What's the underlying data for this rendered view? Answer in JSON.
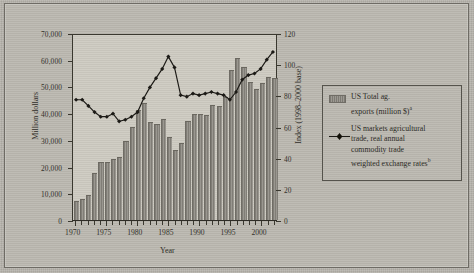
{
  "chart_data": {
    "type": "bar",
    "title": "",
    "xlabel": "Year",
    "ylabel": "Million dollars",
    "y2label": "Index (1998–2000 base)",
    "ylim": [
      0,
      70000
    ],
    "y2lim": [
      0,
      120
    ],
    "xlim": [
      1969.5,
      2002.5
    ],
    "grid": false,
    "legend_position": "right-outside",
    "ytick_labels": [
      "0",
      "10,000",
      "20,000",
      "30,000",
      "40,000",
      "50,000",
      "60,000",
      "70,000"
    ],
    "ytick_values": [
      0,
      10000,
      20000,
      30000,
      40000,
      50000,
      60000,
      70000
    ],
    "y2tick_labels": [
      "0",
      "20",
      "40",
      "60",
      "80",
      "100",
      "120"
    ],
    "y2tick_values": [
      0,
      20,
      40,
      60,
      80,
      100,
      120
    ],
    "xtick_labels": [
      "1970",
      "1975",
      "1980",
      "1985",
      "1990",
      "1995",
      "2000"
    ],
    "xtick_values": [
      1970,
      1975,
      1980,
      1985,
      1990,
      1995,
      2000
    ],
    "categories": [
      1970,
      1971,
      1972,
      1973,
      1974,
      1975,
      1976,
      1977,
      1978,
      1979,
      1980,
      1981,
      1982,
      1983,
      1984,
      1985,
      1986,
      1987,
      1988,
      1989,
      1990,
      1991,
      1992,
      1993,
      1994,
      1995,
      1996,
      1997,
      1998,
      1999,
      2000,
      2001,
      2002
    ],
    "series": [
      {
        "name": "US Total ag. exports (million $)",
        "type": "bar",
        "axis": "left",
        "color": "#8e8b83",
        "values": [
          7300,
          7800,
          9400,
          17700,
          21900,
          21900,
          22800,
          23600,
          29400,
          34700,
          41200,
          43800,
          36600,
          36100,
          37800,
          31200,
          26300,
          28700,
          37100,
          39700,
          39500,
          39400,
          43100,
          42600,
          46000,
          56300,
          60500,
          57200,
          51800,
          49100,
          51200,
          53500,
          53300
        ]
      },
      {
        "name": "US markets agricultural trade, real annual commodity trade weighted exchange rates",
        "type": "line",
        "axis": "right",
        "color": "#1c1a16",
        "marker": "diamond",
        "values": [
          78,
          78,
          74,
          70,
          67,
          67,
          69,
          64,
          65,
          67,
          70,
          79,
          86,
          92,
          98,
          106,
          99,
          81,
          80,
          82,
          81,
          82,
          83,
          82,
          81,
          78,
          83,
          91,
          94,
          95,
          98,
          104,
          109
        ]
      }
    ]
  },
  "legend": {
    "items": [
      {
        "key": "bar-swatch",
        "line1": "US Total ag.",
        "line2": "exports (million $)",
        "sup": "a"
      },
      {
        "key": "line-marker",
        "line1": "US markets agricultural",
        "line2": "trade, real annual",
        "line3": "commodity trade",
        "line4": "weighted exchange rates",
        "sup": "b"
      }
    ]
  }
}
